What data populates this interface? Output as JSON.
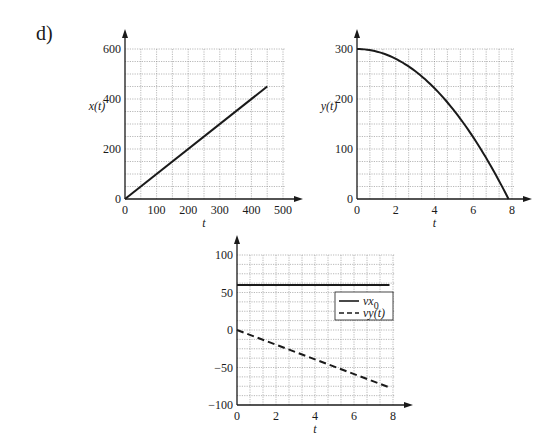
{
  "panel_label": "d)",
  "chart_data": [
    {
      "type": "line",
      "title": "",
      "xlabel": "t",
      "ylabel": "x(t)",
      "xlim": [
        0,
        500
      ],
      "ylim": [
        0,
        600
      ],
      "xticks": [
        0,
        100,
        200,
        300,
        400,
        500
      ],
      "yticks": [
        0,
        200,
        400,
        600
      ],
      "grid": true,
      "grid_x_step": 50,
      "grid_y_step": 50,
      "series": [
        {
          "name": "x(t)",
          "style": "solid",
          "x": [
            0,
            450
          ],
          "y": [
            0,
            450
          ]
        }
      ]
    },
    {
      "type": "line",
      "title": "",
      "xlabel": "t",
      "ylabel": "y(t)",
      "xlim": [
        0,
        8
      ],
      "ylim": [
        0,
        300
      ],
      "xticks": [
        0,
        2,
        4,
        6,
        8
      ],
      "yticks": [
        0,
        100,
        200,
        300
      ],
      "grid": true,
      "grid_x_step": 0.667,
      "grid_y_step": 25,
      "series": [
        {
          "name": "y(t)",
          "style": "solid",
          "x": [
            0,
            1,
            2,
            3,
            4,
            5,
            6,
            7,
            7.82
          ],
          "y": [
            300,
            295.1,
            280.4,
            255.9,
            221.6,
            177.5,
            123.6,
            59.9,
            0
          ]
        }
      ]
    },
    {
      "type": "line",
      "title": "",
      "xlabel": "t",
      "ylabel": "",
      "xlim": [
        0,
        8
      ],
      "ylim": [
        -100,
        100
      ],
      "xticks": [
        0,
        2,
        4,
        6,
        8
      ],
      "yticks": [
        -100,
        -50,
        0,
        50,
        100
      ],
      "grid": true,
      "grid_x_step": 0.667,
      "grid_y_step": 12.5,
      "legend": {
        "position": "right-middle",
        "entries": [
          "vx0",
          "vy(t)"
        ]
      },
      "series": [
        {
          "name": "vx0",
          "style": "solid",
          "x": [
            0,
            7.82
          ],
          "y": [
            60,
            60
          ]
        },
        {
          "name": "vy(t)",
          "style": "dashed",
          "x": [
            0,
            7.82
          ],
          "y": [
            0,
            -76.6
          ]
        }
      ]
    }
  ]
}
